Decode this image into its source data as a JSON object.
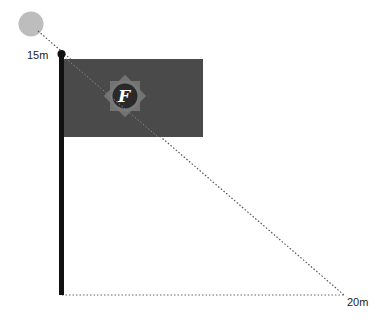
{
  "diagram": {
    "type": "flagpole-shadow-geometry",
    "labels": {
      "height": "15m",
      "distance": "20m"
    },
    "emblem": {
      "letter": "F",
      "icon": "star-badge-icon"
    },
    "colors": {
      "sun": "#bdbdbd",
      "pole": "#111111",
      "flag": "#4a4a4a",
      "emblem_star": "#7a7a7a",
      "emblem_circle": "#2a2a2a",
      "emblem_letter": "#ffffff",
      "dotted_line": "#555555"
    }
  }
}
